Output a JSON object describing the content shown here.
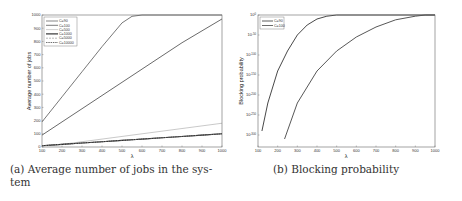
{
  "chart_data": [
    {
      "type": "line",
      "caption": "(a) Average number of jobs in the system",
      "caption_line1": "(a) Average number of jobs in the sys-",
      "caption_line2": "tem",
      "title": "",
      "xlabel": "λ",
      "ylabel": "Average number of jobs",
      "xlim": [
        100,
        1000
      ],
      "ylim": [
        0,
        1000
      ],
      "xticks": [
        100,
        200,
        300,
        400,
        500,
        600,
        700,
        800,
        900,
        1000
      ],
      "yticks": [
        0,
        100,
        200,
        300,
        400,
        500,
        600,
        700,
        800,
        900,
        1000
      ],
      "legend_position": "upper left",
      "x": [
        100,
        200,
        300,
        400,
        500,
        550,
        600,
        700,
        800,
        900,
        1000
      ],
      "series": [
        {
          "name": "C=90",
          "values": [
            190,
            380,
            570,
            760,
            940,
            990,
            1000,
            1000,
            1000,
            1000,
            1000
          ],
          "color": "#555555",
          "dash": ""
        },
        {
          "name": "C=100",
          "values": [
            90,
            190,
            290,
            390,
            490,
            540,
            590,
            690,
            790,
            880,
            970
          ],
          "color": "#444444",
          "dash": ""
        },
        {
          "name": "C=500",
          "values": [
            10,
            20,
            40,
            60,
            80,
            90,
            100,
            120,
            140,
            160,
            180
          ],
          "color": "#bbbbbb",
          "dash": ""
        },
        {
          "name": "C=1000",
          "values": [
            10,
            20,
            30,
            40,
            50,
            55,
            60,
            70,
            80,
            90,
            100
          ],
          "color": "#222222",
          "dash": ""
        },
        {
          "name": "C=5000",
          "values": [
            10,
            20,
            30,
            40,
            50,
            55,
            60,
            70,
            80,
            90,
            100
          ],
          "color": "#999999",
          "dash": "2,1"
        },
        {
          "name": "C=10000",
          "values": [
            10,
            20,
            30,
            40,
            50,
            55,
            60,
            70,
            80,
            90,
            100
          ],
          "color": "#333333",
          "dash": "1.5,0.8"
        }
      ],
      "grid": false
    },
    {
      "type": "line",
      "caption": "(b) Blocking probability",
      "title": "",
      "xlabel": "λ",
      "ylabel": "Blocking probability",
      "xlim": [
        100,
        1000
      ],
      "yscale": "log",
      "ylim_exponent": [
        -300,
        0
      ],
      "xticks": [
        100,
        200,
        300,
        400,
        500,
        600,
        700,
        800,
        900,
        1000
      ],
      "yticks": [
        "10^0",
        "10^-50",
        "10^-100",
        "10^-150",
        "10^-200",
        "10^-250",
        "10^-300"
      ],
      "legend_position": "upper left",
      "series": [
        {
          "name": "C=90",
          "x": [
            120,
            150,
            200,
            250,
            300,
            350,
            400,
            450,
            500,
            1000
          ],
          "log10_values": [
            -290,
            -220,
            -140,
            -90,
            -50,
            -25,
            -10,
            -3,
            0,
            0
          ],
          "color": "#333333"
        },
        {
          "name": "C=100",
          "x": [
            235,
            300,
            400,
            500,
            600,
            700,
            800,
            900,
            950,
            1000
          ],
          "log10_values": [
            -310,
            -220,
            -140,
            -90,
            -55,
            -30,
            -12,
            -3,
            0,
            0
          ],
          "color": "#444444"
        }
      ],
      "grid": false
    }
  ],
  "axes_a": {
    "xtick_labels": [
      "100",
      "200",
      "300",
      "400",
      "500",
      "600",
      "700",
      "800",
      "900",
      "1000"
    ],
    "ytick_labels": [
      "0",
      "100",
      "200",
      "300",
      "400",
      "500",
      "600",
      "700",
      "800",
      "900",
      "1000"
    ],
    "xlabel": "λ",
    "ylabel": "Average number of jobs",
    "legend": [
      "C=90",
      "C=100",
      "C=500",
      "C=1000",
      "C=5000",
      "C=10000"
    ]
  },
  "axes_b": {
    "xtick_labels": [
      "100",
      "200",
      "300",
      "400",
      "500",
      "600",
      "700",
      "800",
      "900",
      "1000"
    ],
    "ytick_base": [
      "10",
      "10",
      "10",
      "10",
      "10",
      "10",
      "10"
    ],
    "ytick_exp": [
      "0",
      "-50",
      "-100",
      "-150",
      "-200",
      "-250",
      "-300"
    ],
    "xlabel": "λ",
    "ylabel": "Blocking probability",
    "legend": [
      "C=90",
      "C=100"
    ]
  },
  "captions": {
    "a_line1": "(a) Average number of jobs in the sys-",
    "a_line2": "tem",
    "b": "(b) Blocking probability"
  }
}
